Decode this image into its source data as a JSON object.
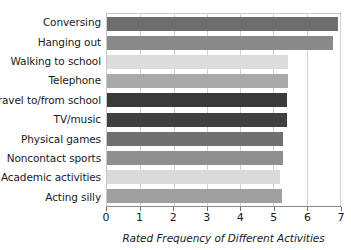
{
  "chart_data": {
    "type": "bar",
    "orientation": "horizontal",
    "title": "",
    "xlabel": "Rated Frequency of Different Activities",
    "ylabel": "",
    "xlim": [
      0,
      7
    ],
    "ylim": null,
    "grid": true,
    "legend": false,
    "xticks": [
      0,
      1,
      2,
      3,
      4,
      5,
      6,
      7
    ],
    "xtick_labels": [
      "0",
      "1",
      "2",
      "3",
      "4",
      "5",
      "6",
      "7"
    ],
    "categories": [
      "Conversing",
      "Hanging out",
      "Walking to school",
      "Telephone",
      "Travel to/from school",
      "TV/music",
      "Physical games",
      "Noncontact sports",
      "Academic activities",
      "Acting silly"
    ],
    "values": [
      6.95,
      6.8,
      5.45,
      5.45,
      5.4,
      5.4,
      5.3,
      5.3,
      5.2,
      5.25
    ],
    "bar_colors": [
      "#6e6e6e",
      "#8a8a8a",
      "#dcdcdc",
      "#a9a9a9",
      "#3a3a3a",
      "#404040",
      "#707070",
      "#8f8f8f",
      "#dadada",
      "#a0a0a0"
    ]
  },
  "axis": {
    "x_title": "Rated Frequency of Different Activities"
  }
}
